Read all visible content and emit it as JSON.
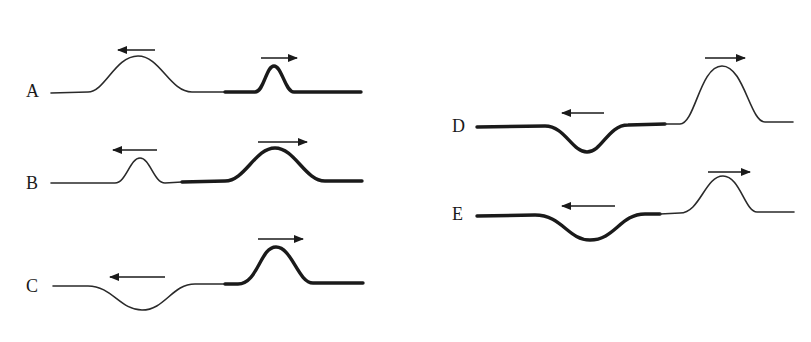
{
  "diagram": {
    "colors": {
      "ink": "#1a1a1a",
      "background": "#ffffff"
    },
    "options": [
      {
        "label": "A",
        "left_pulse": {
          "string": "thin",
          "shape": "crest",
          "direction": "left"
        },
        "right_pulse": {
          "string": "thick",
          "shape": "crest",
          "direction": "right"
        }
      },
      {
        "label": "B",
        "left_pulse": {
          "string": "thin",
          "shape": "crest",
          "direction": "left"
        },
        "right_pulse": {
          "string": "thick",
          "shape": "crest",
          "direction": "right"
        }
      },
      {
        "label": "C",
        "left_pulse": {
          "string": "thin",
          "shape": "trough",
          "direction": "left"
        },
        "right_pulse": {
          "string": "thick",
          "shape": "crest",
          "direction": "right"
        }
      },
      {
        "label": "D",
        "left_pulse": {
          "string": "thick",
          "shape": "trough",
          "direction": "left"
        },
        "right_pulse": {
          "string": "thin",
          "shape": "crest",
          "direction": "right"
        }
      },
      {
        "label": "E",
        "left_pulse": {
          "string": "thick",
          "shape": "trough",
          "direction": "left"
        },
        "right_pulse": {
          "string": "thin",
          "shape": "crest",
          "direction": "right"
        }
      }
    ]
  }
}
